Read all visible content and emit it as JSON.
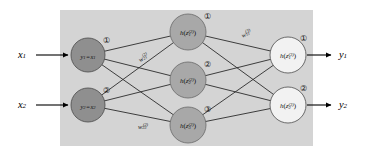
{
  "figure": {
    "type": "neural-network-diagram",
    "width": 365,
    "height": 158,
    "background_color": "#ffffff",
    "panel_color": "#d4d4d4",
    "edge_color": "#2b2b2b"
  },
  "panel": {
    "x": 60,
    "y": 10,
    "width": 253,
    "height": 136
  },
  "inputs": [
    {
      "label": "x",
      "sub": "1",
      "x": 22,
      "y": 55
    },
    {
      "label": "x",
      "sub": "2",
      "x": 22,
      "y": 105
    }
  ],
  "outputs": [
    {
      "label": "y",
      "sub": "1",
      "x": 341,
      "y": 55
    },
    {
      "label": "y",
      "sub": "2",
      "x": 341,
      "y": 105
    }
  ],
  "layers": [
    {
      "name": "input-layer",
      "fill": "#8f8f8f",
      "stroke": "#4a4a4a",
      "radius": 17,
      "nodes": [
        {
          "id": "input-node-1",
          "cx": 88,
          "cy": 55,
          "badge": "①",
          "main": "y",
          "main_sub": "1",
          "eq": "=",
          "arg": "x",
          "arg_sub": "1"
        },
        {
          "id": "input-node-2",
          "cx": 88,
          "cy": 105,
          "badge": "②",
          "main": "y",
          "main_sub": "2",
          "eq": "=",
          "arg": "x",
          "arg_sub": "2"
        }
      ]
    },
    {
      "name": "hidden-layer",
      "fill": "#a8a8a8",
      "stroke": "#6a6a6a",
      "radius": 18,
      "nodes": [
        {
          "id": "hidden-node-1",
          "cx": 188,
          "cy": 32,
          "badge": "①",
          "fn": "h",
          "var": "z",
          "sub": "1",
          "sup": "(2)"
        },
        {
          "id": "hidden-node-2",
          "cx": 188,
          "cy": 80,
          "badge": "②",
          "fn": "h",
          "var": "z",
          "sub": "2",
          "sup": "(2)"
        },
        {
          "id": "hidden-node-3",
          "cx": 188,
          "cy": 125,
          "badge": "③",
          "fn": "h",
          "var": "z",
          "sub": "3",
          "sup": "(2)"
        }
      ]
    },
    {
      "name": "output-layer",
      "fill": "#f2f2f2",
      "stroke": "#4a4a4a",
      "radius": 18,
      "nodes": [
        {
          "id": "output-node-1",
          "cx": 288,
          "cy": 55,
          "badge": "①",
          "fn": "h",
          "var": "z",
          "sub": "1",
          "sup": "(3)"
        },
        {
          "id": "output-node-2",
          "cx": 288,
          "cy": 105,
          "badge": "②",
          "fn": "h",
          "var": "z",
          "sub": "2",
          "sup": "(3)"
        }
      ]
    }
  ],
  "weights": [
    {
      "id": "weight-w21-2",
      "symbol": "w",
      "sub": "21",
      "sup": "(2)",
      "x": 143,
      "y": 57,
      "rotate": -32
    },
    {
      "id": "weight-w23-2",
      "symbol": "w",
      "sub": "23",
      "sup": "(2)",
      "x": 143,
      "y": 126,
      "rotate": 0
    },
    {
      "id": "weight-w11-3",
      "symbol": "w",
      "sub": "11",
      "sup": "(3)",
      "x": 246,
      "y": 33,
      "rotate": -22
    }
  ],
  "connections": {
    "input_to_hidden": "fully-connected",
    "hidden_to_output": "fully-connected",
    "count_input_to_hidden": 6,
    "count_hidden_to_output": 6
  },
  "arrows": {
    "input_arrows": [
      {
        "id": "input-arrow-1",
        "x1": 36,
        "y1": 55,
        "x2": 68,
        "y2": 55
      },
      {
        "id": "input-arrow-2",
        "x1": 36,
        "y1": 105,
        "x2": 68,
        "y2": 105
      }
    ],
    "output_arrows": [
      {
        "id": "output-arrow-1",
        "x1": 307,
        "y1": 55,
        "x2": 332,
        "y2": 55
      },
      {
        "id": "output-arrow-2",
        "x1": 307,
        "y1": 105,
        "x2": 332,
        "y2": 105
      }
    ]
  }
}
